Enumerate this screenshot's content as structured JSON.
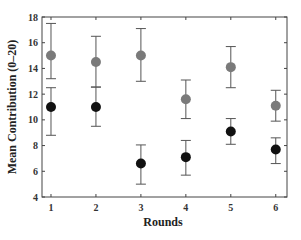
{
  "chart_data": {
    "type": "scatter",
    "title": "",
    "xlabel": "Rounds",
    "ylabel": "Mean Contribution (0–20)",
    "categories": [
      "1",
      "2",
      "3",
      "4",
      "5",
      "6"
    ],
    "x": [
      1,
      2,
      3,
      4,
      5,
      6
    ],
    "xlim": [
      0.8,
      6.25
    ],
    "ylim": [
      4,
      18
    ],
    "yticks": [
      4,
      6,
      8,
      10,
      12,
      14,
      16,
      18
    ],
    "xticks": [
      1,
      2,
      3,
      4,
      5,
      6
    ],
    "grid": false,
    "legend": null,
    "series": [
      {
        "name": "Grey series",
        "color": "#7a7a7a",
        "values": [
          15.0,
          14.5,
          15.0,
          11.6,
          14.1,
          11.1
        ],
        "error_upper": [
          17.5,
          16.5,
          17.1,
          13.1,
          15.7,
          12.3
        ],
        "error_lower": [
          13.2,
          12.55,
          13.0,
          10.1,
          12.5,
          9.9
        ]
      },
      {
        "name": "Black series",
        "color": "#111111",
        "values": [
          11.0,
          11.0,
          6.6,
          7.1,
          9.1,
          7.7
        ],
        "error_upper": [
          12.5,
          12.55,
          8.05,
          8.4,
          10.1,
          8.6
        ],
        "error_lower": [
          8.8,
          9.5,
          5.0,
          5.7,
          8.1,
          6.6
        ]
      }
    ]
  }
}
